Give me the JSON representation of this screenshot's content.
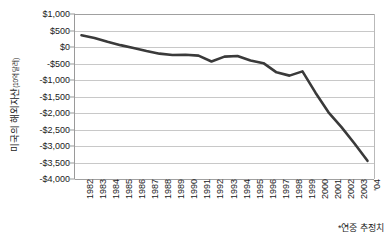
{
  "chart_data": {
    "type": "line",
    "title": "",
    "xlabel": "",
    "ylabel": "미국의 해외자산",
    "ylabel_unit": "(10억 달러)",
    "ylim": [
      -4000,
      1000
    ],
    "ytick_step": 500,
    "grid": true,
    "legend": "none",
    "line_color": "#3a3a3a",
    "grid_color": "#c8c8c8",
    "axis_color": "#9a9a9a",
    "categories": [
      "1982",
      "1983",
      "1984",
      "1985",
      "1986",
      "1987",
      "1988",
      "1989",
      "1990",
      "1991",
      "1992",
      "1993",
      "1994",
      "1995",
      "1996",
      "1997",
      "1998",
      "1999",
      "2000",
      "2001",
      "2002",
      "2003",
      "'04"
    ],
    "ytick_labels": [
      "$1,000",
      "$500",
      "$0",
      "-$500",
      "-$1,000",
      "-$1,500",
      "-$2,000",
      "-$2,500",
      "-$3,000",
      "-$3,500",
      "-$4,000"
    ],
    "ytick_values": [
      1000,
      500,
      0,
      -500,
      -1000,
      -1500,
      -2000,
      -2500,
      -3000,
      -3500,
      -4000
    ],
    "series": [
      {
        "name": "미국의 해외자산",
        "values": [
          350,
          270,
          150,
          50,
          -40,
          -130,
          -210,
          -250,
          -245,
          -270,
          -450,
          -300,
          -280,
          -420,
          -500,
          -780,
          -880,
          -750,
          -1400,
          -2000,
          -2450,
          -2950,
          -3480
        ]
      }
    ],
    "annotations": [
      {
        "text": "*연중 추정치",
        "position": "bottom-right"
      }
    ]
  },
  "footnote": "*연중 추정치"
}
